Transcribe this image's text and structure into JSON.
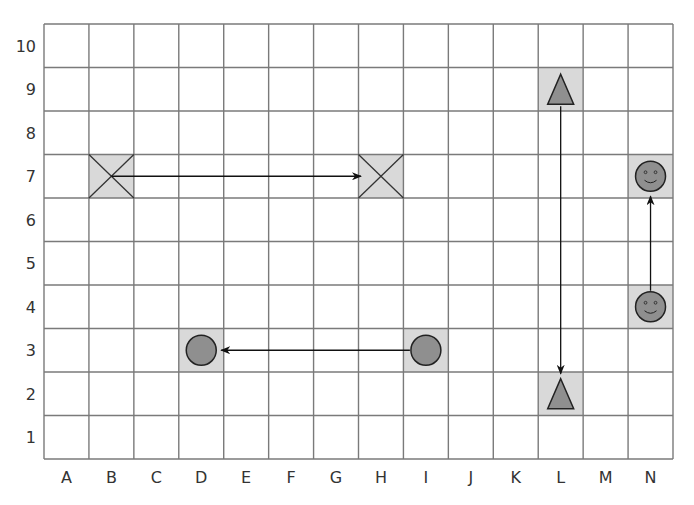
{
  "grid": {
    "columns": [
      "A",
      "B",
      "C",
      "D",
      "E",
      "F",
      "G",
      "H",
      "I",
      "J",
      "K",
      "L",
      "M",
      "N"
    ],
    "rows": [
      "1",
      "2",
      "3",
      "4",
      "5",
      "6",
      "7",
      "8",
      "9",
      "10"
    ],
    "left": 44,
    "top": 24,
    "right": 673,
    "bottom": 459,
    "line_color": "#7a7a7a",
    "highlight_color": "#d9d9d9"
  },
  "shapes_fill": "#8f8f8f",
  "moves": [
    {
      "shape": "cross",
      "from": "B7",
      "to": "H7",
      "direction": "right"
    },
    {
      "shape": "circle",
      "from": "I3",
      "to": "D3",
      "direction": "left"
    },
    {
      "shape": "triangle",
      "from": "L9",
      "to": "L2",
      "direction": "down"
    },
    {
      "shape": "smiley",
      "from": "N4",
      "to": "N7",
      "direction": "up"
    }
  ]
}
